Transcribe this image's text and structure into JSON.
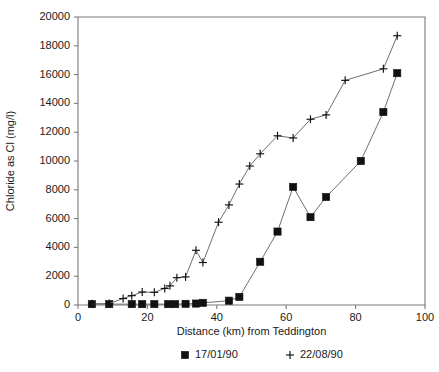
{
  "chart_data": {
    "type": "line",
    "title": "",
    "xlabel": "Distance (km) from Teddington",
    "ylabel": "Chloride as Cl (mg/l)",
    "xlim": [
      0,
      100
    ],
    "ylim": [
      0,
      20000
    ],
    "xticks": [
      0,
      20,
      40,
      60,
      80,
      100
    ],
    "yticks": [
      0,
      2000,
      4000,
      6000,
      8000,
      10000,
      12000,
      14000,
      16000,
      18000,
      20000
    ],
    "xtick_labels": [
      "0",
      "20",
      "40",
      "60",
      "80",
      "100"
    ],
    "ytick_labels": [
      "0",
      "2000",
      "4000",
      "6000",
      "8000",
      "10000",
      "12000",
      "14000",
      "16000",
      "18000",
      "20000"
    ],
    "grid": false,
    "legend_position": "below-axis",
    "series": [
      {
        "name": "17/01/90",
        "marker": "square",
        "color": "#111111",
        "points": [
          {
            "x": 4,
            "y": 60
          },
          {
            "x": 9,
            "y": 60
          },
          {
            "x": 15.5,
            "y": 60
          },
          {
            "x": 18.5,
            "y": 60
          },
          {
            "x": 22,
            "y": 60
          },
          {
            "x": 26,
            "y": 60
          },
          {
            "x": 28,
            "y": 60
          },
          {
            "x": 31,
            "y": 80
          },
          {
            "x": 34,
            "y": 100
          },
          {
            "x": 36,
            "y": 150
          },
          {
            "x": 43.5,
            "y": 300
          },
          {
            "x": 46.5,
            "y": 560
          },
          {
            "x": 52.5,
            "y": 3000
          },
          {
            "x": 57.5,
            "y": 5100
          },
          {
            "x": 62,
            "y": 8200
          },
          {
            "x": 67,
            "y": 6100
          },
          {
            "x": 71.5,
            "y": 7500
          },
          {
            "x": 81.5,
            "y": 10000
          },
          {
            "x": 88,
            "y": 13400
          },
          {
            "x": 92,
            "y": 16100
          }
        ]
      },
      {
        "name": "22/08/90",
        "marker": "plus",
        "color": "#111111",
        "points": [
          {
            "x": 4,
            "y": 80
          },
          {
            "x": 9,
            "y": 100
          },
          {
            "x": 13,
            "y": 450
          },
          {
            "x": 15.5,
            "y": 650
          },
          {
            "x": 18.5,
            "y": 900
          },
          {
            "x": 22,
            "y": 880
          },
          {
            "x": 25,
            "y": 1150
          },
          {
            "x": 26.5,
            "y": 1330
          },
          {
            "x": 28.5,
            "y": 1900
          },
          {
            "x": 31,
            "y": 1950
          },
          {
            "x": 34,
            "y": 3800
          },
          {
            "x": 36,
            "y": 2950
          },
          {
            "x": 40.5,
            "y": 5750
          },
          {
            "x": 43.5,
            "y": 6950
          },
          {
            "x": 46.5,
            "y": 8400
          },
          {
            "x": 49.5,
            "y": 9650
          },
          {
            "x": 52.5,
            "y": 10500
          },
          {
            "x": 57.5,
            "y": 11750
          },
          {
            "x": 62,
            "y": 11600
          },
          {
            "x": 67,
            "y": 12900
          },
          {
            "x": 71.5,
            "y": 13200
          },
          {
            "x": 77,
            "y": 15600
          },
          {
            "x": 88,
            "y": 16400
          },
          {
            "x": 92,
            "y": 18700
          }
        ]
      }
    ],
    "legend": [
      {
        "label": "17/01/90",
        "marker": "square"
      },
      {
        "label": "22/08/90",
        "marker": "plus"
      }
    ]
  }
}
